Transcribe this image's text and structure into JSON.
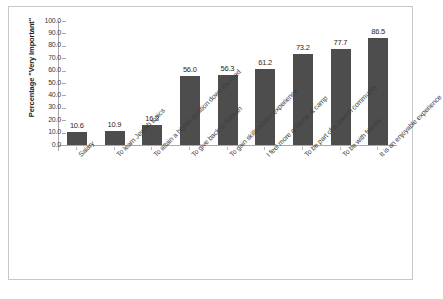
{
  "chart_data": {
    "type": "bar",
    "title": "",
    "xlabel": "",
    "ylabel": "Percentage \"Very Important\"",
    "ylim": [
      0,
      100
    ],
    "yticks": [
      "0.0",
      "10.0",
      "20.0",
      "30.0",
      "40.0",
      "50.0",
      "60.0",
      "70.0",
      "80.0",
      "90.0",
      "100.0"
    ],
    "grid": false,
    "legend": null,
    "bar_color": "#4d4d4d",
    "categories": [
      "Salary",
      "To learn Jewish topics",
      "To attain a higher position down the road",
      "To give back to Ramah",
      "To gain skills and/or experience",
      "I feel more at home at camp",
      "To be part of a Jewish community",
      "To be with friends",
      "It is an enjoyable experience"
    ],
    "values": [
      10.6,
      10.9,
      16.2,
      56.0,
      56.3,
      61.2,
      73.2,
      77.7,
      86.5
    ],
    "data_labels": [
      "10.6",
      "10.9",
      "16.2",
      "56.0",
      "56.3",
      "61.2",
      "73.2",
      "77.7",
      "86.5"
    ]
  }
}
